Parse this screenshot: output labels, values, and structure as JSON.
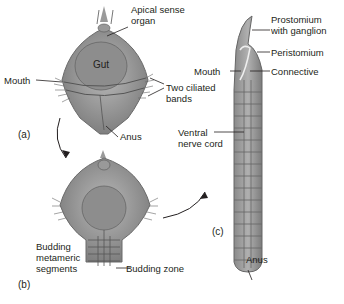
{
  "figure": {
    "panels": [
      {
        "id": "a",
        "label": "(a)"
      },
      {
        "id": "b",
        "label": "(b)"
      },
      {
        "id": "c",
        "label": "(c)"
      }
    ],
    "labels": {
      "apical_sense_organ": "Apical sense\norgan",
      "gut": "Gut",
      "mouth_a": "Mouth",
      "two_ciliated_bands": "Two ciliated\nbands",
      "anus_a": "Anus",
      "budding_metameric_segments": "Budding\nmetameric\nsegments",
      "budding_zone": "Budding zone",
      "prostomium": "Prostomium\nwith ganglion",
      "peristomium": "Peristomium",
      "mouth_c": "Mouth",
      "connective": "Connective",
      "ventral_nerve_cord": "Ventral\nnerve cord",
      "anus_c": "Anus"
    },
    "colors": {
      "body_light": "#b3b3b3",
      "body_mid": "#8f8f8f",
      "body_dark": "#6e6e6e",
      "line": "#231f20"
    }
  }
}
